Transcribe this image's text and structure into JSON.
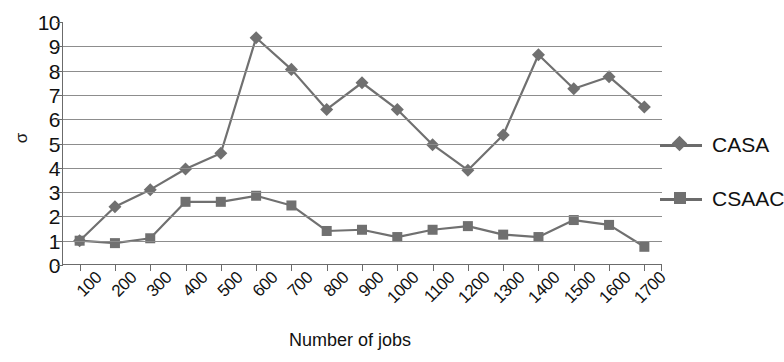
{
  "chart_data": {
    "type": "line",
    "title": "",
    "xlabel": "Number of jobs",
    "ylabel": "σ",
    "x": [
      100,
      200,
      300,
      400,
      500,
      600,
      700,
      800,
      900,
      1000,
      1100,
      1200,
      1300,
      1400,
      1500,
      1600,
      1700
    ],
    "xtick_labels": [
      "100",
      "200",
      "300",
      "400",
      "500",
      "600",
      "700",
      "800",
      "900",
      "1000",
      "1100",
      "1200",
      "1300",
      "1400",
      "1500",
      "1600",
      "1700"
    ],
    "ytick_labels": [
      "0",
      "1",
      "2",
      "3",
      "4",
      "5",
      "6",
      "7",
      "8",
      "9",
      "10"
    ],
    "ylim": [
      0,
      10
    ],
    "ytick_step": 1,
    "grid": "horizontal",
    "legend_position": "right",
    "series": [
      {
        "name": "CASA",
        "marker": "diamond",
        "color": "#707070",
        "values": [
          1.0,
          2.4,
          3.1,
          3.95,
          4.6,
          9.35,
          8.05,
          6.4,
          7.5,
          6.4,
          4.95,
          3.9,
          5.35,
          8.65,
          7.25,
          7.75,
          6.5
        ]
      },
      {
        "name": "CSAAC",
        "marker": "square",
        "color": "#707070",
        "values": [
          1.0,
          0.9,
          1.1,
          2.6,
          2.6,
          2.85,
          2.45,
          1.4,
          1.45,
          1.15,
          1.45,
          1.6,
          1.25,
          1.15,
          1.85,
          1.65,
          0.75
        ]
      }
    ]
  },
  "legend": {
    "items": [
      {
        "label": "CASA",
        "marker": "diamond"
      },
      {
        "label": "CSAAC",
        "marker": "square"
      }
    ]
  },
  "axes": {
    "x_title": "Number of jobs",
    "y_title": "σ"
  },
  "colors": {
    "series": "#707070",
    "gridline": "#8d8d8d",
    "axis": "#6b6b6b",
    "text": "#111111",
    "background": "#ffffff"
  }
}
